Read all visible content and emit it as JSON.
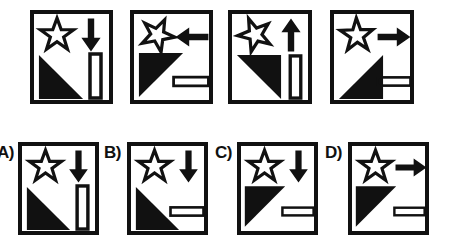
{
  "puzzle": {
    "type": "visual-analogy-matrix",
    "description": "Sequence of four framed panels each containing a star, an arrow, a filled triangle and a hollow rectangle, followed by four lettered answer choices.",
    "stroke_color": "#111111",
    "fill_color": "#111111",
    "background_color": "#ffffff"
  },
  "sequence": {
    "name": "sequence-row",
    "panels": [
      {
        "id": "sequence-panel-1",
        "position": 1,
        "star": {
          "name": "star-outline",
          "rotation_deg": 0,
          "style": "outline"
        },
        "arrow": {
          "name": "arrow-down",
          "direction": "down",
          "style": "solid"
        },
        "triangle": {
          "name": "triangle-right-angle-top-left",
          "right_angle": "top-left",
          "style": "solid"
        },
        "rectangle": {
          "name": "rectangle-vertical",
          "orientation": "vertical",
          "style": "outline"
        }
      },
      {
        "id": "sequence-panel-2",
        "position": 2,
        "star": {
          "name": "star-outline",
          "rotation_deg": 25,
          "style": "outline"
        },
        "arrow": {
          "name": "arrow-left",
          "direction": "left",
          "style": "solid"
        },
        "triangle": {
          "name": "triangle-right-angle-top-left",
          "right_angle": "top-left",
          "style": "solid"
        },
        "rectangle": {
          "name": "rectangle-horizontal",
          "orientation": "horizontal",
          "style": "outline"
        }
      },
      {
        "id": "sequence-panel-3",
        "position": 3,
        "star": {
          "name": "star-outline",
          "rotation_deg": 50,
          "style": "outline"
        },
        "arrow": {
          "name": "arrow-up",
          "direction": "up",
          "style": "solid"
        },
        "triangle": {
          "name": "triangle-right-angle-top-right",
          "right_angle": "top-right",
          "style": "solid"
        },
        "rectangle": {
          "name": "rectangle-vertical",
          "orientation": "vertical",
          "style": "outline"
        }
      },
      {
        "id": "sequence-panel-4",
        "position": 4,
        "star": {
          "name": "star-outline",
          "rotation_deg": 70,
          "style": "outline"
        },
        "arrow": {
          "name": "arrow-right",
          "direction": "right",
          "style": "solid"
        },
        "triangle": {
          "name": "triangle-right-angle-bottom-right",
          "right_angle": "bottom-right",
          "style": "solid"
        },
        "rectangle": {
          "name": "rectangle-horizontal",
          "orientation": "horizontal",
          "style": "outline"
        }
      }
    ]
  },
  "options": {
    "name": "answer-options-row",
    "items": [
      {
        "id": "option-a",
        "label": "A)",
        "letter": "A",
        "star": {
          "name": "star-outline",
          "rotation_deg": 0,
          "style": "outline"
        },
        "arrow": {
          "name": "arrow-down",
          "direction": "down",
          "style": "solid"
        },
        "triangle": {
          "name": "triangle-right-angle-top-left",
          "right_angle": "top-left",
          "style": "solid"
        },
        "rectangle": {
          "name": "rectangle-vertical",
          "orientation": "vertical",
          "style": "outline"
        }
      },
      {
        "id": "option-b",
        "label": "B)",
        "letter": "B",
        "star": {
          "name": "star-outline",
          "rotation_deg": 0,
          "style": "outline"
        },
        "arrow": {
          "name": "arrow-down",
          "direction": "down",
          "style": "solid"
        },
        "triangle": {
          "name": "triangle-right-angle-top-left",
          "right_angle": "top-left",
          "style": "solid"
        },
        "rectangle": {
          "name": "rectangle-horizontal",
          "orientation": "horizontal",
          "style": "outline"
        }
      },
      {
        "id": "option-c",
        "label": "C)",
        "letter": "C",
        "star": {
          "name": "star-outline",
          "rotation_deg": 0,
          "style": "outline"
        },
        "arrow": {
          "name": "arrow-down",
          "direction": "down",
          "style": "solid"
        },
        "triangle": {
          "name": "triangle-right-angle-top-left-narrow",
          "right_angle": "top-left",
          "style": "solid"
        },
        "rectangle": {
          "name": "rectangle-horizontal",
          "orientation": "horizontal",
          "style": "outline"
        }
      },
      {
        "id": "option-d",
        "label": "D)",
        "letter": "D",
        "star": {
          "name": "star-outline",
          "rotation_deg": 0,
          "style": "outline"
        },
        "arrow": {
          "name": "arrow-right",
          "direction": "right",
          "style": "solid"
        },
        "triangle": {
          "name": "triangle-right-angle-top-left-narrow",
          "right_angle": "top-left",
          "style": "solid"
        },
        "rectangle": {
          "name": "rectangle-horizontal",
          "orientation": "horizontal",
          "style": "outline"
        }
      }
    ]
  }
}
